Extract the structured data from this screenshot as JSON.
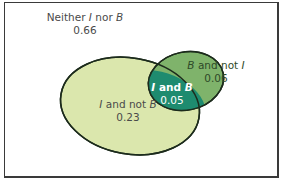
{
  "diagram": {
    "type": "venn",
    "colors": {
      "frame": "#3a3a3a",
      "i_not_b": "#dbe7ad",
      "b_not_i": "#7fb36b",
      "i_and_b": "#1e8b6f",
      "outline": "#1c2b1c"
    },
    "regions": {
      "neither": {
        "label_prefix": "Neither ",
        "i": "I",
        "mid": " nor ",
        "b": "B",
        "value": "0.66"
      },
      "i_not_b": {
        "i": "I",
        "mid": " and not ",
        "b": "B",
        "value": "0.23"
      },
      "b_not_i": {
        "b": "B",
        "mid": " and not ",
        "i": "I",
        "value": "0.06"
      },
      "i_and_b": {
        "i": "I",
        "mid": " and ",
        "b": "B",
        "value": "0.05"
      }
    }
  }
}
